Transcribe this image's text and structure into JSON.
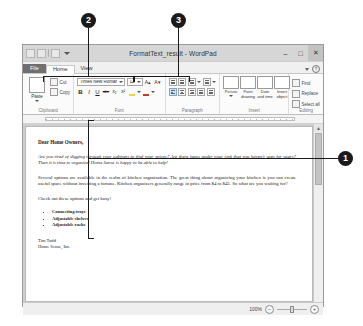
{
  "callouts": [
    {
      "id": "callout-1",
      "label": "1"
    },
    {
      "id": "callout-2",
      "label": "2"
    },
    {
      "id": "callout-3",
      "label": "3"
    }
  ],
  "window": {
    "title": "FormatText_result - WordPad",
    "quick_access": {
      "save_icon": "save-icon",
      "undo_icon": "undo-icon",
      "redo_icon": "redo-icon",
      "customize_icon": "chevron-down-icon"
    },
    "controls": {
      "minimize": "–",
      "maximize": "□",
      "close": "✕"
    }
  },
  "tabs": [
    {
      "name": "tab-file",
      "label": "File",
      "active": false
    },
    {
      "name": "tab-home",
      "label": "Home",
      "active": true
    },
    {
      "name": "tab-view",
      "label": "View",
      "active": false
    }
  ],
  "tab_helpers": {
    "collapse_icon": "chevron-up-icon",
    "help_label": "?"
  },
  "ribbon": {
    "groups": [
      {
        "name": "clipboard",
        "label": "Clipboard",
        "big_button": {
          "label": "Paste",
          "icon": "paste-icon"
        },
        "small_buttons": [
          {
            "label": "Cut",
            "icon": "cut-icon"
          },
          {
            "label": "Copy",
            "icon": "copy-icon"
          }
        ]
      },
      {
        "name": "font",
        "label": "Font",
        "font_family": "Times New Roman",
        "font_size": "12",
        "grow_icon": "grow-font-icon",
        "shrink_icon": "shrink-font-icon",
        "bold": "B",
        "italic": "I",
        "underline": "U",
        "strikethrough": "abc",
        "subscript": "x₂",
        "superscript": "x²",
        "highlight_icon": "text-highlight-icon",
        "fontcolor_icon": "font-color-icon"
      },
      {
        "name": "paragraph",
        "label": "Paragraph",
        "decrease_indent_icon": "decrease-indent-icon",
        "increase_indent_icon": "increase-indent-icon",
        "bullets_icon": "bullets-icon",
        "line_spacing_icon": "line-spacing-icon",
        "align_left_icon": "align-left-icon",
        "align_center_icon": "align-center-icon",
        "align_right_icon": "align-right-icon",
        "justify_icon": "justify-icon",
        "paragraph_settings_icon": "paragraph-settings-icon"
      },
      {
        "name": "insert",
        "label": "Insert",
        "buttons": [
          {
            "label": "Picture",
            "icon": "picture-icon",
            "has_menu": true
          },
          {
            "label": "Paint drawing",
            "icon": "paint-drawing-icon"
          },
          {
            "label": "Date and time",
            "icon": "date-time-icon"
          },
          {
            "label": "Insert object",
            "icon": "insert-object-icon"
          }
        ]
      },
      {
        "name": "editing",
        "label": "Editing",
        "buttons": [
          {
            "label": "Find",
            "icon": "find-icon"
          },
          {
            "label": "Replace",
            "icon": "replace-icon"
          },
          {
            "label": "Select all",
            "icon": "select-all-icon"
          }
        ]
      }
    ]
  },
  "document": {
    "greeting": "Dear Home Owners,",
    "paragraph1": "Are you tired of digging through your cabinets to find your spices? Are there items under your sink that you haven't seen for years? Then it is time to organize! Home Sense is happy to be able to help!",
    "paragraph2": "Several options are available in the realm of kitchen organization. The great thing about organizing your kitchen is you can create useful space without investing a fortune. Kitchen organizers generally range in price from $4 to $45. So what are you waiting for?",
    "paragraph3": "Check out these options and get busy!",
    "bullets": [
      "Connecting trays",
      "Adjustable shelves",
      "Adjustable racks"
    ],
    "signature_name": "Tim Todd",
    "signature_company": "Home Sense, Inc."
  },
  "statusbar": {
    "zoom_level": "100%",
    "zoom_out": "–",
    "zoom_in": "+"
  },
  "scrollbar": {
    "up_arrow": "▲",
    "down_arrow": "▼"
  }
}
